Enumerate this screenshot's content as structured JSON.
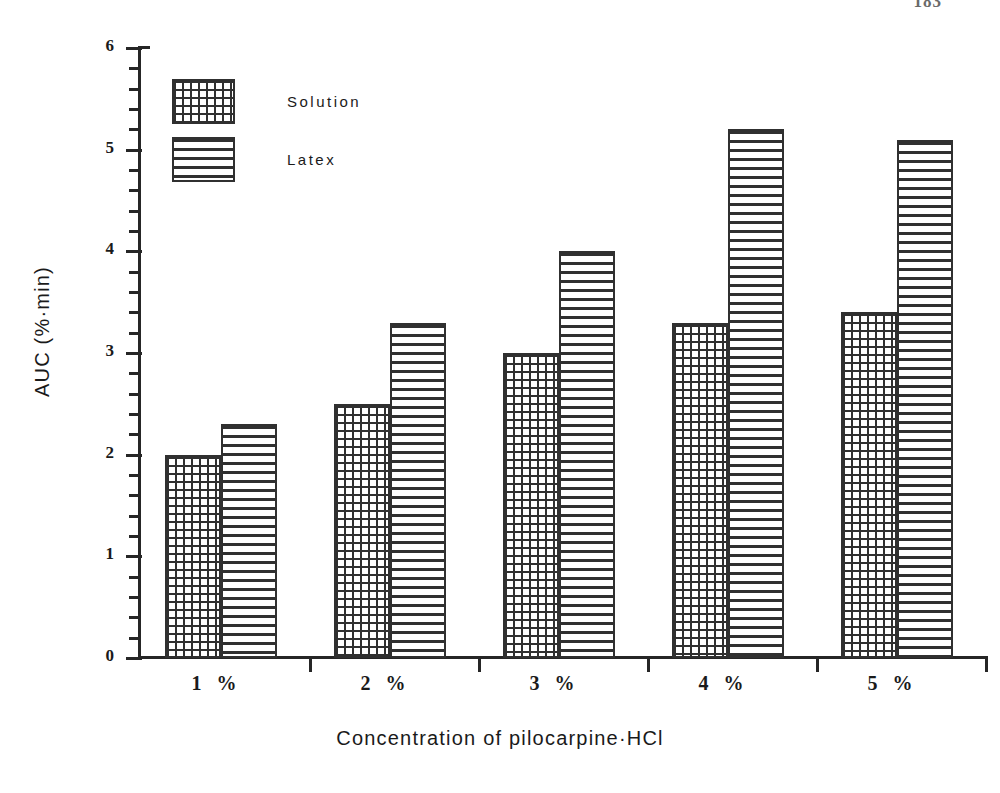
{
  "page": {
    "page_number": "183"
  },
  "chart_data": {
    "type": "bar",
    "title": "",
    "xlabel": "Concentration of pilocarpine·HCl",
    "ylabel": "AUC (%·min)",
    "categories": [
      "1 %",
      "2 %",
      "3 %",
      "4 %",
      "5 %"
    ],
    "series": [
      {
        "name": "Solution",
        "pattern": "cross-hatch-grid",
        "values": [
          2.0,
          2.5,
          3.0,
          3.3,
          3.4
        ]
      },
      {
        "name": "Latex",
        "pattern": "horizontal-lines",
        "values": [
          2.3,
          3.3,
          4.0,
          5.2,
          5.1
        ]
      }
    ],
    "ylim": [
      0,
      6
    ],
    "y_major_ticks": [
      0,
      1,
      2,
      3,
      4,
      5,
      6
    ],
    "y_tick_labels": [
      "0",
      "1",
      "2",
      "3",
      "4",
      "5",
      "6"
    ],
    "y_minor_tick_step": 0.2,
    "grid": false,
    "legend_position": "top-left",
    "legend_entries": [
      "Solution",
      "Latex"
    ],
    "colors": {
      "ink": "#303030",
      "background": "#ffffff"
    }
  }
}
